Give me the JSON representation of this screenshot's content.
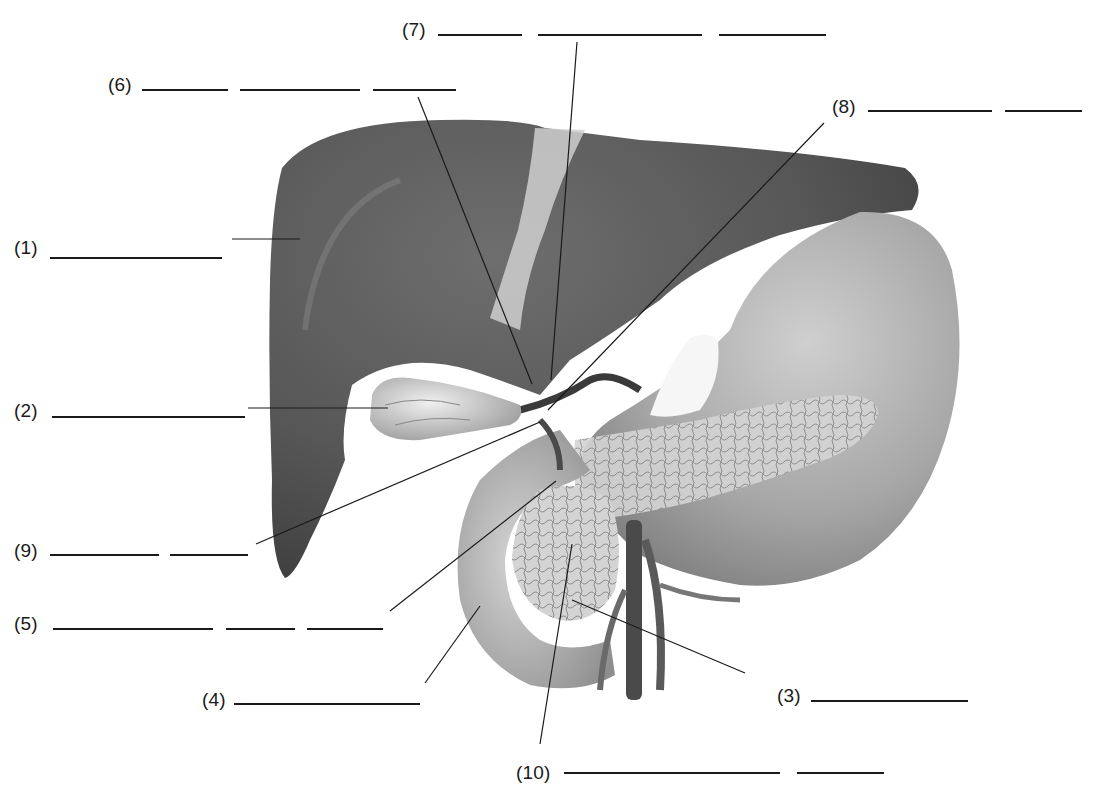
{
  "diagram": {
    "type": "anatomical labeling worksheet",
    "colors": {
      "ink": "#1a1a1a",
      "liver": "#5a5a5a",
      "stomach": "#a8a8a8",
      "pancreas": "#c8c8c8",
      "background": "#ffffff"
    }
  },
  "labels": [
    {
      "id": "1",
      "text": "(1)",
      "x": 14,
      "y": 238,
      "blanks": [
        [
          50,
          222
        ]
      ],
      "blank_y": 257,
      "leader": [
        [
          232,
          239
        ],
        [
          300,
          239
        ]
      ]
    },
    {
      "id": "2",
      "text": "(2)",
      "x": 14,
      "y": 401,
      "blanks": [
        [
          52,
          245
        ]
      ],
      "blank_y": 416,
      "leader": [
        [
          248,
          408
        ],
        [
          388,
          408
        ]
      ]
    },
    {
      "id": "3",
      "text": "(3)",
      "x": 777,
      "y": 686,
      "blanks": [
        [
          811,
          968
        ]
      ],
      "blank_y": 700,
      "leader": [
        [
          745,
          673
        ],
        [
          572,
          600
        ]
      ]
    },
    {
      "id": "4",
      "text": "(4)",
      "x": 202,
      "y": 690,
      "blanks": [
        [
          234,
          420
        ]
      ],
      "blank_y": 703,
      "leader": [
        [
          425,
          683
        ],
        [
          480,
          606
        ]
      ]
    },
    {
      "id": "5",
      "text": "(5)",
      "x": 14,
      "y": 614,
      "blanks": [
        [
          53,
          213
        ],
        [
          226,
          295
        ],
        [
          307,
          383
        ]
      ],
      "blank_y": 628,
      "leader": [
        [
          390,
          611
        ],
        [
          556,
          481
        ]
      ]
    },
    {
      "id": "6",
      "text": "(6)",
      "x": 108,
      "y": 75,
      "blanks": [
        [
          142,
          228
        ],
        [
          240,
          360
        ],
        [
          373,
          456
        ]
      ],
      "blank_y": 89,
      "leader": [
        [
          418,
          97
        ],
        [
          532,
          384
        ]
      ]
    },
    {
      "id": "7",
      "text": "(7)",
      "x": 402,
      "y": 20,
      "blanks": [
        [
          438,
          522
        ],
        [
          538,
          702
        ],
        [
          719,
          826
        ]
      ],
      "blank_y": 34,
      "leader": [
        [
          577,
          42
        ],
        [
          551,
          380
        ]
      ]
    },
    {
      "id": "8",
      "text": "(8)",
      "x": 832,
      "y": 97,
      "blanks": [
        [
          868,
          992
        ],
        [
          1005,
          1082
        ]
      ],
      "blank_y": 110,
      "leader": [
        [
          824,
          123
        ],
        [
          548,
          410
        ]
      ]
    },
    {
      "id": "9",
      "text": "(9)",
      "x": 14,
      "y": 541,
      "blanks": [
        [
          50,
          159
        ],
        [
          170,
          248
        ]
      ],
      "blank_y": 554,
      "leader": [
        [
          256,
          544
        ],
        [
          540,
          422
        ]
      ]
    },
    {
      "id": "10",
      "text": "(10)",
      "x": 516,
      "y": 763,
      "blanks": [
        [
          564,
          780
        ],
        [
          797,
          884
        ]
      ],
      "blank_y": 772,
      "leader": [
        [
          540,
          744
        ],
        [
          572,
          544
        ]
      ]
    }
  ]
}
